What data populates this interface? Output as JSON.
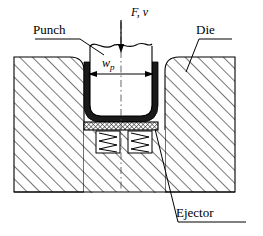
{
  "figure": {
    "type": "technical-cross-section-diagram",
    "background_color": "#ffffff",
    "line_color": "#000000",
    "hatch_color": "#555555",
    "sheet_color": "#1a1a1a"
  },
  "labels": {
    "punch": "Punch",
    "die": "Die",
    "ejector": "Ejector",
    "force_velocity": "F, v",
    "width_symbol": "w",
    "width_subscript": "p"
  },
  "annotations": {
    "force_arrow": "downward arrow on vertical centerline indicating punch force F and velocity v",
    "width_dimension": "horizontal double headed arrow measuring punch width w_p",
    "centerline": "vertical dash-dot centerline through the middle of the punch and die",
    "break_line": "wavy break line across the top of the punch body",
    "leader_punch": "leader line from Punch label down-right to the punch wall",
    "leader_die": "leader line from Die label down-left into the die block",
    "leader_ejector": "leader line from Ejector label up-left to the ejector plate"
  },
  "components": {
    "die_block": {
      "name": "Die",
      "fill": "diagonal-hatch",
      "bounds": {
        "x": 14,
        "y": 57,
        "width": 221,
        "height": 135
      }
    },
    "punch": {
      "name": "Punch",
      "fill": "white",
      "bounds": {
        "x": 88,
        "y": 40,
        "width": 64,
        "height": 82
      }
    },
    "sheet_blank": {
      "name": "sheet-blank",
      "fill": "solid-dark",
      "description": "U shaped dark band formed around the punch"
    },
    "ejector_plate": {
      "name": "Ejector",
      "fill": "fine-cross-hatch",
      "bounds": {
        "x": 84,
        "y": 122,
        "width": 74,
        "height": 8
      }
    },
    "springs": [
      {
        "name": "spring-left",
        "bounds": {
          "x": 96,
          "y": 131,
          "width": 24,
          "height": 22
        }
      },
      {
        "name": "spring-right",
        "bounds": {
          "x": 128,
          "y": 131,
          "width": 24,
          "height": 22
        }
      }
    ]
  }
}
